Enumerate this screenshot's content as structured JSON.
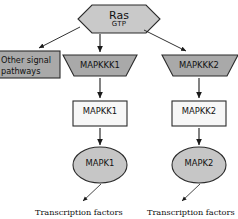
{
  "diagram": {
    "title_text": "MAPK signalling cascade",
    "colors": {
      "stroke": "#2b2b2b",
      "trapezoid_fill": "#a9a9a9",
      "hexagon_fill": "#c9c9c9",
      "ellipse_fill": "#c6c6c6",
      "rect_fill": "#f7f7f7",
      "box_fill": "#a9a9a9",
      "arrow": "#1a1a1a",
      "background": "#ffffff"
    },
    "nodes": {
      "ras": {
        "shape": "hexagon",
        "label": "Ras",
        "sublabel": "GTP"
      },
      "other_signal": {
        "shape": "rectangle",
        "label": "Other signal pathways"
      },
      "mapkkk1": {
        "shape": "trapezoid",
        "label": "MAPKKK1"
      },
      "mapkkk2": {
        "shape": "trapezoid",
        "label": "MAPKKK2"
      },
      "mapkk1": {
        "shape": "rectangle",
        "label": "MAPKK1"
      },
      "mapkk2": {
        "shape": "rectangle",
        "label": "MAPKK2"
      },
      "mapk1": {
        "shape": "ellipse",
        "label": "MAPK1"
      },
      "mapk2": {
        "shape": "ellipse",
        "label": "MAPK2"
      },
      "transcription_factors_left": {
        "shape": "text",
        "label": "Transcription factors"
      },
      "transcription_factors_right": {
        "shape": "text",
        "label": "Transcription factors"
      }
    },
    "edges": [
      {
        "from": "ras",
        "to": "other_signal",
        "style": "diagonal-arrow"
      },
      {
        "from": "ras",
        "to": "mapkkk1",
        "style": "vertical-arrow"
      },
      {
        "from": "ras",
        "to": "mapkkk2",
        "style": "diagonal-arrow"
      },
      {
        "from": "mapkkk1",
        "to": "mapkk1",
        "style": "vertical-arrow"
      },
      {
        "from": "mapkkk2",
        "to": "mapkk2",
        "style": "vertical-arrow"
      },
      {
        "from": "mapkk1",
        "to": "mapk1",
        "style": "vertical-arrow"
      },
      {
        "from": "mapkk2",
        "to": "mapk2",
        "style": "vertical-arrow"
      },
      {
        "from": "mapk1",
        "to": "transcription_factors_left",
        "style": "diagonal-arrow"
      },
      {
        "from": "mapk2",
        "to": "transcription_factors_right",
        "style": "diagonal-arrow"
      }
    ]
  }
}
